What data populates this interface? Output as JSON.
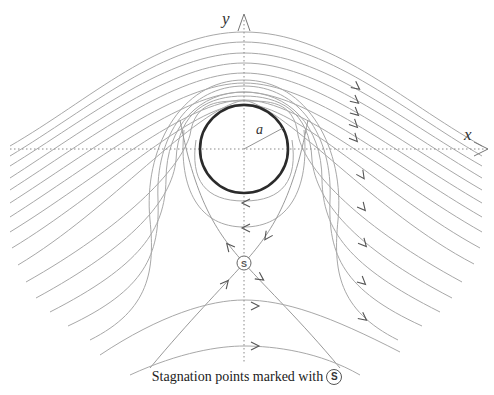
{
  "diagram": {
    "axes": {
      "x_label": "x",
      "y_label": "y",
      "origin": [
        244,
        149
      ],
      "x_axis": {
        "from": 10,
        "to": 490
      },
      "y_axis": {
        "from": 18,
        "to": 362
      }
    },
    "cylinder": {
      "center": [
        244,
        149
      ],
      "radius": 44,
      "radius_label": "a",
      "radius_end": [
        283,
        128
      ]
    },
    "stagnation_point": {
      "position": [
        244,
        263
      ],
      "marker_label": "S"
    },
    "caption": {
      "text": "Stagnation points marked with",
      "marker": "S"
    },
    "streamlines": [
      "M 10 146 C 90 100, 160 32, 244 32 C 330 32, 400 100, 482 146",
      "M 10 156 C 90 108, 165 42, 244 42 C 325 42, 400 108, 482 156",
      "M 10 166 C 88 118, 168 53, 244 53 C 322 53, 398 118, 482 166",
      "M 10 178 C 88 128, 172 63, 244 63 C 318 63, 398 128, 482 178",
      "M 10 190 C 88 140, 175 73, 244 73 C 314 73, 396 140, 482 190",
      "M 10 203 C 90 152, 178 83, 244 83 C 311 83, 394 152, 482 203",
      "M 10 217 C 92 165, 182 92, 244 92 C 307 92, 392 165, 482 217",
      "M 10 232 C 95 180, 186 100, 244 100 C 303 100, 390 180, 482 232",
      "M 12 248 C 100 195, 190 105, 244 104 C 298 104, 384 196, 480 248",
      "M 18 265 C 110 210, 193 110, 244 100 C 290 110, 374 212, 474 264",
      "M 26 282 C 122 228, 180 170, 190 135 C 195 100, 220 101, 244 101 C 268 101, 294 100, 298 135 C 306 172, 362 228, 462 282",
      "M 36 298 C 132 246, 172 200, 176 160 C 178 110, 210 96, 244 96 C 278 96, 310 110, 312 160 C 316 200, 352 246, 452 298",
      "M 50 312 C 140 266, 165 230, 166 180 C 166 125, 200 92, 244 92 C 288 92, 322 125, 322 180 C 323 230, 348 266, 440 312",
      "M 68 326 C 145 290, 160 255, 158 200 C 155 135, 190 86, 244 86 C 298 86, 333 135, 330 200 C 328 255, 343 290, 422 326",
      "M 90 340 C 150 310, 155 270, 150 220 C 143 150, 180 80, 244 80 C 308 80, 345 150, 338 220 C 333 270, 338 310, 398 340"
    ],
    "inner_loops": [
      "M 196 140 C 190 180, 205 201, 244 201 C 283 201, 298 180, 292 140",
      "M 184 130 C 178 190, 200 227, 244 227 C 288 227, 310 190, 304 130"
    ],
    "separatrices": [
      "M 150 368 C 190 320, 220 290, 244 263 C 268 236, 292 205, 308 120",
      "M 180 120 C 196 205, 220 236, 244 263 C 268 290, 300 320, 340 368"
    ],
    "lower_arcs": [
      "M 100 355 C 160 315, 210 300, 244 300 C 285 300, 330 316, 400 352",
      "M 130 375 C 180 352, 220 346, 244 346 C 275 346, 320 352, 360 375"
    ],
    "arrows": [
      {
        "x": 358,
        "y": 88,
        "rot": 38
      },
      {
        "x": 357,
        "y": 102,
        "rot": 40
      },
      {
        "x": 357,
        "y": 114,
        "rot": 42
      },
      {
        "x": 356,
        "y": 126,
        "rot": 45
      },
      {
        "x": 356,
        "y": 140,
        "rot": 48
      },
      {
        "x": 363,
        "y": 177,
        "rot": 55
      },
      {
        "x": 364,
        "y": 209,
        "rot": 50
      },
      {
        "x": 365,
        "y": 245,
        "rot": 48
      },
      {
        "x": 364,
        "y": 283,
        "rot": 42
      },
      {
        "x": 365,
        "y": 319,
        "rot": 38
      },
      {
        "x": 244,
        "y": 203,
        "rot": 180
      },
      {
        "x": 244,
        "y": 228,
        "rot": 180
      },
      {
        "x": 228,
        "y": 245,
        "rot": 230
      },
      {
        "x": 266,
        "y": 238,
        "rot": 125
      },
      {
        "x": 227,
        "y": 282,
        "rot": -50
      },
      {
        "x": 262,
        "y": 279,
        "rot": 35
      },
      {
        "x": 257,
        "y": 306,
        "rot": 0
      },
      {
        "x": 257,
        "y": 346,
        "rot": 0
      }
    ],
    "colors": {
      "streamline": "#a8a8a8",
      "cylinder": "#2b2b2b",
      "arrow": "#555555",
      "background": "#ffffff"
    }
  }
}
